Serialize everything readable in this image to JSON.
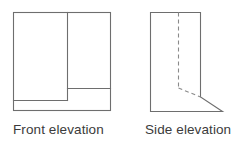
{
  "figure": {
    "type": "technical-drawing",
    "background_color": "#ffffff",
    "line_color": "#6e6e6e",
    "dashed_line_color": "#8a8a8a",
    "line_width": 1.1,
    "views": [
      {
        "id": "front-elevation",
        "caption": "Front elevation",
        "outline": {
          "shape": "rectangle",
          "x": 13,
          "y": 12,
          "width": 98,
          "height": 99
        },
        "internal_lines": [
          {
            "name": "vertical-divider",
            "type": "solid",
            "x1": 67,
            "y1": 12,
            "x2": 67,
            "y2": 100
          },
          {
            "name": "right-horizontal-ledge",
            "type": "solid",
            "x1": 67,
            "y1": 88,
            "x2": 111,
            "y2": 88
          },
          {
            "name": "left-horizontal-base",
            "type": "solid",
            "x1": 13,
            "y1": 100,
            "x2": 67,
            "y2": 100
          }
        ]
      },
      {
        "id": "side-elevation",
        "caption": "Side elevation",
        "outline": {
          "shape": "polygon",
          "points": "150,12 201,12 201,97 223,112 150,112"
        },
        "internal_lines": [
          {
            "name": "hidden-vertical-edge",
            "type": "dashed",
            "x1": 178,
            "y1": 12,
            "x2": 178,
            "y2": 88,
            "dash": "4 3"
          },
          {
            "name": "hidden-slope-edge",
            "type": "dashed",
            "x1": 178,
            "y1": 88,
            "x2": 201,
            "y2": 97,
            "dash": "4 3"
          }
        ]
      }
    ]
  },
  "captions": {
    "front": "Front elevation",
    "side": "Side elevation"
  }
}
